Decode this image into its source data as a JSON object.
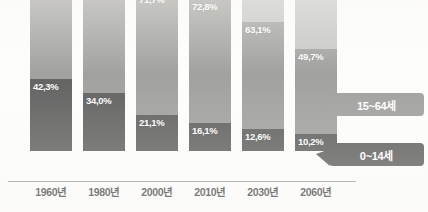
{
  "chart_data": {
    "type": "bar",
    "title": "",
    "subtitle": "",
    "xlabel": "",
    "ylabel": "",
    "stacked": true,
    "stack_mode": "percent",
    "ylim": [
      0,
      100
    ],
    "grid": false,
    "legend_position": "callout-right",
    "categories": [
      "1960년",
      "1980년",
      "2000년",
      "2010년",
      "2030년",
      "2060년"
    ],
    "series": [
      {
        "name": "0~14세",
        "color": "#3c3c3c",
        "values": [
          42.3,
          34.0,
          21.1,
          16.1,
          12.6,
          10.2
        ],
        "labels": [
          "42,3%",
          "34,0%",
          "21,1%",
          "16,1%",
          "12,6%",
          "10,2%"
        ]
      },
      {
        "name": "15~64세",
        "color": "#8a8a88",
        "values": [
          54.8,
          62.2,
          71.7,
          72.8,
          63.1,
          49.7
        ],
        "labels": [
          "54,8%",
          "62,2%",
          "71,7%",
          "72,8%",
          "63,1%",
          "49,7%"
        ]
      },
      {
        "name": "65세 이상",
        "color": "#b9b9b7",
        "values": [
          2.9,
          3.8,
          7.2,
          11.1,
          24.3,
          40.1
        ],
        "labels": [
          "",
          "",
          "",
          "",
          "",
          ""
        ]
      }
    ],
    "annotations": [
      {
        "text": "15~64세",
        "target_series": "15~64세",
        "color": "#8a8a88"
      },
      {
        "text": "0~14세",
        "target_series": "0~14세",
        "color": "#3c3c3c"
      }
    ]
  },
  "axis": {
    "tick_labels": [
      "1960년",
      "1980년",
      "2000년",
      "2010년",
      "2030년",
      "2060년"
    ]
  },
  "callouts": {
    "adult": {
      "label": "15~64세"
    },
    "child": {
      "label": "0~14세"
    }
  },
  "colors": {
    "elderly": "#b9b9b7",
    "working_age": "#8a8a88",
    "children": "#3c3c3c",
    "axis": "#8c8c8a",
    "background": "#fdfdfc",
    "label_text": "#ffffff",
    "tick_text": "#1c1c1c"
  }
}
